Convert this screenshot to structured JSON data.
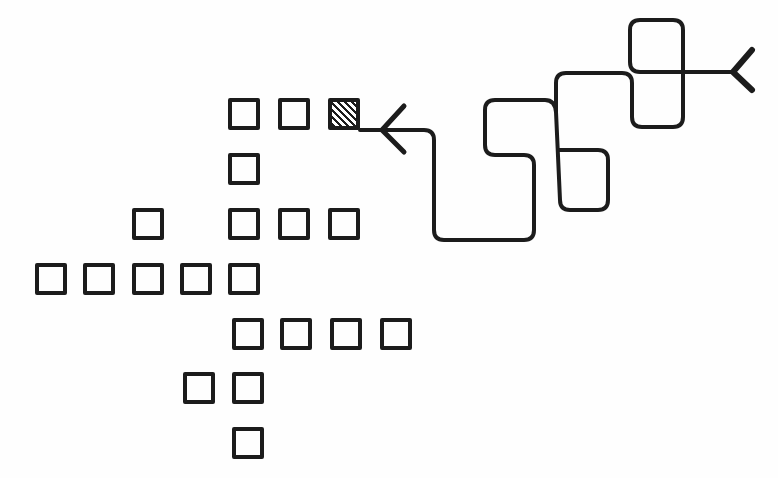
{
  "canvas": {
    "width": 778,
    "height": 478,
    "background": "#fefefe",
    "stroke_color": "#1c1c1c"
  },
  "grid": {
    "cell_size": 32,
    "stroke_width": 4,
    "cells": [
      {
        "id": "r1c1",
        "x": 228,
        "y": 98,
        "hatched": false
      },
      {
        "id": "r1c2",
        "x": 278,
        "y": 98,
        "hatched": false
      },
      {
        "id": "r1c3",
        "x": 328,
        "y": 98,
        "hatched": true
      },
      {
        "id": "r2c1",
        "x": 228,
        "y": 153,
        "hatched": false
      },
      {
        "id": "r3c0",
        "x": 132,
        "y": 208,
        "hatched": false
      },
      {
        "id": "r3c1",
        "x": 228,
        "y": 208,
        "hatched": false
      },
      {
        "id": "r3c2",
        "x": 278,
        "y": 208,
        "hatched": false
      },
      {
        "id": "r3c3",
        "x": 328,
        "y": 208,
        "hatched": false
      },
      {
        "id": "r4c0",
        "x": 35,
        "y": 263,
        "hatched": false
      },
      {
        "id": "r4c1",
        "x": 83,
        "y": 263,
        "hatched": false
      },
      {
        "id": "r4c2",
        "x": 132,
        "y": 263,
        "hatched": false
      },
      {
        "id": "r4c3",
        "x": 180,
        "y": 263,
        "hatched": false
      },
      {
        "id": "r4c4",
        "x": 228,
        "y": 263,
        "hatched": false
      },
      {
        "id": "r5c1",
        "x": 232,
        "y": 318,
        "hatched": false
      },
      {
        "id": "r5c2",
        "x": 280,
        "y": 318,
        "hatched": false
      },
      {
        "id": "r5c3",
        "x": 330,
        "y": 318,
        "hatched": false
      },
      {
        "id": "r5c4",
        "x": 380,
        "y": 318,
        "hatched": false
      },
      {
        "id": "r6c0",
        "x": 183,
        "y": 372,
        "hatched": false
      },
      {
        "id": "r6c1",
        "x": 232,
        "y": 372,
        "hatched": false
      },
      {
        "id": "r7c1",
        "x": 232,
        "y": 427,
        "hatched": false
      }
    ]
  },
  "path": {
    "stroke_width": 4,
    "d": "M 360 130 L 424 130 Q 434 130 434 140 L 434 230 Q 434 240 444 240 L 524 240 Q 534 240 534 230 L 534 165 Q 534 155 524 155 L 495 155 Q 485 155 485 145 L 485 110 Q 485 100 495 100 L 545 100 Q 555 100 556 112 L 560 200 Q 560 210 570 210 L 598 210 Q 608 210 608 200 L 608 160 Q 608 150 598 150 L 560 150 M 556 112 L 556 83 Q 556 73 566 73 L 622 73 Q 632 73 632 83 L 632 117 Q 632 127 642 127 L 673 127 Q 683 127 683 117 L 683 30 Q 683 20 673 20 L 640 20 Q 630 20 630 30 L 630 62 Q 630 72 640 72 L 733 72",
    "start_arrow": {
      "tip_x": 382,
      "tip_y": 130,
      "arm1": [
        404,
        106
      ],
      "arm2": [
        404,
        152
      ]
    },
    "end_fork": {
      "base_x": 733,
      "base_y": 72,
      "arm1": [
        752,
        50
      ],
      "arm2": [
        752,
        90
      ]
    }
  }
}
